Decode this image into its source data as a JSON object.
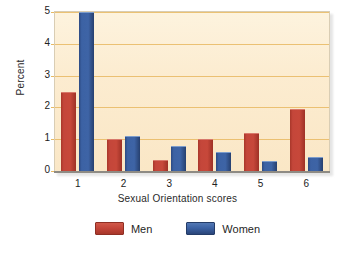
{
  "chart_data": {
    "type": "bar",
    "title": "",
    "xlabel": "Sexual Orientation scores",
    "ylabel": "Percent",
    "categories": [
      "1",
      "2",
      "3",
      "4",
      "5",
      "6"
    ],
    "series": [
      {
        "name": "Men",
        "color": "#c4463a",
        "values": [
          2.5,
          1.0,
          0.35,
          1.0,
          1.2,
          1.95
        ]
      },
      {
        "name": "Women",
        "color": "#3c62a4",
        "values": [
          5.0,
          1.1,
          0.8,
          0.6,
          0.3,
          0.45
        ]
      }
    ],
    "ylim": [
      0,
      5
    ],
    "yticks": [
      0,
      1,
      2,
      3,
      4,
      5
    ],
    "ytick_labels": [
      "0",
      "1",
      "2",
      "3",
      "4",
      "5"
    ],
    "grid": true,
    "grid_color": "#e8b962",
    "legend_position": "bottom",
    "plot_background": "#fbeccf"
  },
  "legend": {
    "items": [
      {
        "label": "Men",
        "color": "#c4463a"
      },
      {
        "label": "Women",
        "color": "#3c62a4"
      }
    ]
  }
}
